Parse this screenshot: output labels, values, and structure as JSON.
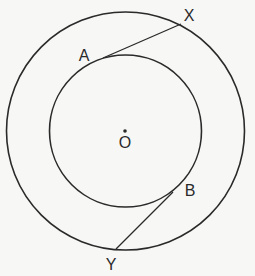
{
  "diagram": {
    "type": "concentric-circles-tangents",
    "stroke_color": "#2a2a2a",
    "background_color": "#f7f7f5",
    "center": {
      "label": "O",
      "x": 125,
      "y": 131
    },
    "outer_circle": {
      "cx": 125.5,
      "cy": 131,
      "r": 119
    },
    "inner_circle": {
      "cx": 125.5,
      "cy": 131,
      "r": 76
    },
    "points": {
      "A": {
        "label": "A",
        "x": 103,
        "y": 58,
        "label_x": 84,
        "label_y": 61
      },
      "X": {
        "label": "X",
        "x": 181,
        "y": 24,
        "label_x": 189,
        "label_y": 21
      },
      "B": {
        "label": "B",
        "x": 173,
        "y": 192,
        "label_x": 184,
        "label_y": 196
      },
      "Y": {
        "label": "Y",
        "x": 116,
        "y": 249,
        "label_x": 110,
        "label_y": 270
      }
    },
    "segments": [
      {
        "name": "AX",
        "from": "A",
        "to": "X"
      },
      {
        "name": "BY",
        "from": "B",
        "to": "Y"
      }
    ]
  }
}
